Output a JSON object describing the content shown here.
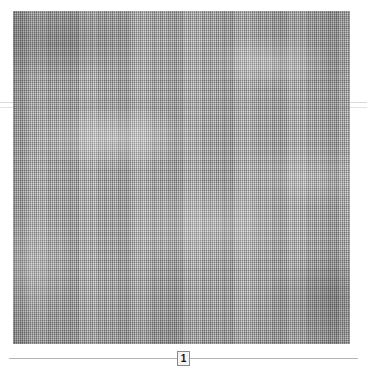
{
  "viewer": {
    "name": "scanned-page-viewer",
    "background_color": "#ffffff"
  },
  "page_image": {
    "label": "woven-canvas-scan",
    "description": "Scanned plain-weave linen canvas, uniform grey warp and weft grid with lighter slubs and darker tonal bands",
    "base_color": "#a8a8a8",
    "light_tone": "#c4c4c4",
    "dark_tone": "#8d8d8d",
    "border_color": "#6e6e6e"
  },
  "fold_rules": {
    "label": "horizontal-fold-line",
    "color": "#d9d9d9",
    "count": "2"
  },
  "pager": {
    "label": "page-navigator",
    "track_color": "#b4b4b4",
    "current_page": "1",
    "box_border_color": "#8a8a8a",
    "box_fill_color": "#f4f4f4"
  }
}
